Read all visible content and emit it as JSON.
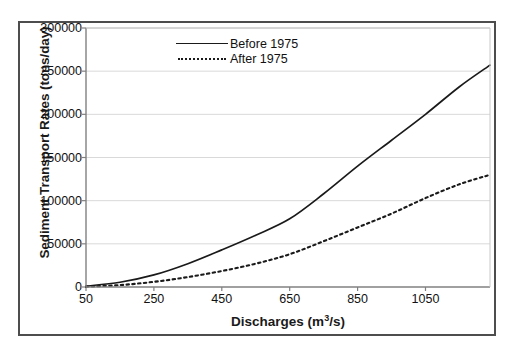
{
  "chart_data": {
    "type": "line",
    "title": "",
    "xlabel": "Discharges (m3/s)",
    "xlabel_base": "Discharges (m",
    "xlabel_sup": "3",
    "xlabel_tail": "/s)",
    "ylabel": "Sediment Transport Rates (tons/day)",
    "xlim": [
      50,
      1240
    ],
    "ylim": [
      0,
      300000
    ],
    "grid": "horizontal",
    "legend_position": "top-center",
    "xticks": [
      50,
      250,
      450,
      650,
      850,
      1050
    ],
    "xtick_labels": [
      "50",
      "250",
      "450",
      "650",
      "850",
      "1050"
    ],
    "yticks": [
      0,
      50000,
      100000,
      150000,
      200000,
      250000,
      300000
    ],
    "ytick_labels": [
      "0",
      "50000",
      "100000",
      "150000",
      "200000",
      "250000",
      "300000"
    ],
    "x": [
      50,
      150,
      250,
      350,
      450,
      550,
      650,
      750,
      850,
      950,
      1050,
      1150,
      1240
    ],
    "series": [
      {
        "name": "Before 1975",
        "style": "solid",
        "color": "#1a1a1a",
        "values": [
          1000,
          5500,
          14000,
          27000,
          43000,
          60000,
          79000,
          108000,
          140000,
          170000,
          200000,
          232000,
          257000
        ]
      },
      {
        "name": "After 1975",
        "style": "dotted",
        "color": "#1a1a1a",
        "values": [
          400,
          2200,
          6000,
          11500,
          18500,
          27000,
          38000,
          53000,
          69000,
          85000,
          103000,
          119000,
          130000
        ]
      }
    ]
  },
  "colors": {
    "frame": "#4d4d4d",
    "axis": "#808080",
    "grid": "#d9d9d9",
    "line": "#1a1a1a",
    "text": "#111111",
    "background": "#ffffff"
  }
}
